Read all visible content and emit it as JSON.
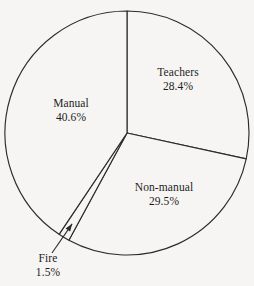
{
  "chart_data": {
    "type": "pie",
    "title": "",
    "subtitle": "",
    "xlabel": "",
    "ylabel": "",
    "legend_position": "none",
    "grid": false,
    "units": "percent",
    "start_angle_deg": 0,
    "direction": "clockwise",
    "categories": [
      "Teachers",
      "Non-manual",
      "Fire",
      "Manual"
    ],
    "values": [
      28.4,
      29.5,
      1.5,
      40.6
    ],
    "slices": [
      {
        "label": "Teachers",
        "value": 28.4,
        "value_text": "28.4%",
        "start_deg": 0.0,
        "sweep_deg": 102.24,
        "exploded": false,
        "callout": false,
        "label_x": 178,
        "label_y": 79
      },
      {
        "label": "Non-manual",
        "value": 29.5,
        "value_text": "29.5%",
        "start_deg": 102.24,
        "sweep_deg": 106.2,
        "exploded": false,
        "callout": false,
        "label_x": 164,
        "label_y": 194
      },
      {
        "label": "Fire",
        "value": 1.5,
        "value_text": "1.5%",
        "start_deg": 208.44,
        "sweep_deg": 5.4,
        "exploded": false,
        "callout": true,
        "label_x": 48,
        "label_y": 265
      },
      {
        "label": "Manual",
        "value": 40.6,
        "value_text": "40.6%",
        "start_deg": 213.84,
        "sweep_deg": 146.16,
        "exploded": false,
        "callout": false,
        "label_x": 71,
        "label_y": 110
      }
    ],
    "geometry": {
      "center_x": 127,
      "center_y": 133,
      "radius": 122
    },
    "colors": {
      "slice_fill": "#f6f5f3",
      "outline": "#2b2b2b",
      "text": "#1d1d1d",
      "background": "#f6f5f3"
    }
  },
  "caption": {
    "text": ""
  }
}
